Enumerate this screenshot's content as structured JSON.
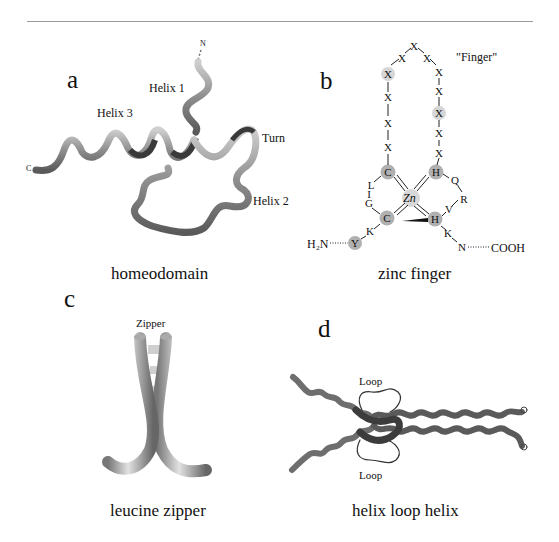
{
  "figure": {
    "panels": [
      {
        "letter": "a",
        "caption": "homeodomain",
        "labels": {
          "helix1": "Helix 1",
          "helix2": "Helix 2",
          "helix3": "Helix 3",
          "turn": "Turn",
          "n_term": "N",
          "c_term": "C"
        }
      },
      {
        "letter": "b",
        "caption": "zinc finger",
        "labels": {
          "finger": "\"Finger\"",
          "metal": "Zn",
          "n_term": "H₂N",
          "c_term": "COOH"
        },
        "residues": {
          "loop_left": [
            "X",
            "X",
            "X",
            "X",
            "X"
          ],
          "loop_top": [
            "X",
            "X",
            "X"
          ],
          "loop_right": [
            "X",
            "X",
            "X",
            "X",
            "X"
          ],
          "cys_top": "C",
          "cys_bottom": "C",
          "his_top": "H",
          "his_bottom": "H",
          "left_linker": [
            "L",
            "I",
            "G"
          ],
          "right_linker": [
            "Q",
            "R",
            "V"
          ],
          "n_side": [
            "Y",
            "K"
          ],
          "c_side": [
            "K",
            "N"
          ]
        }
      },
      {
        "letter": "c",
        "caption": "leucine zipper",
        "labels": {
          "zipper": "Zipper"
        }
      },
      {
        "letter": "d",
        "caption": "helix loop helix",
        "labels": {
          "loop_top": "Loop",
          "loop_bottom": "Loop"
        }
      }
    ],
    "colors": {
      "rule": "#9a9a9a",
      "ribbon": "#8a8a8a",
      "ribbon_dark": "#3a3a3a",
      "highlight_circle": "#b8b8b8",
      "highlight_light": "#d6d6d6",
      "text": "#111111"
    }
  }
}
